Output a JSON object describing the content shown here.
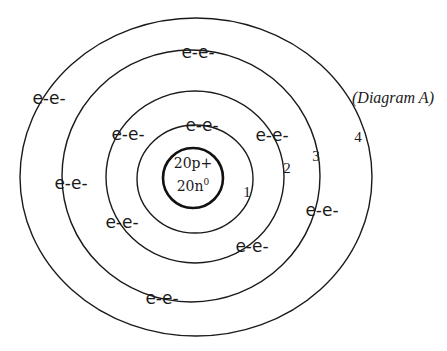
{
  "caption": "(Diagram A)",
  "nucleus": {
    "protons": "20p+",
    "neutrons_base": "20n",
    "neutrons_sup": "0"
  },
  "shells": [
    {
      "number": "1",
      "cx": 195,
      "cy": 179,
      "rx": 58,
      "ry": 54,
      "label_x": 247,
      "label_y": 192
    },
    {
      "number": "2",
      "cx": 195,
      "cy": 177,
      "rx": 89,
      "ry": 86,
      "label_x": 287,
      "label_y": 168
    },
    {
      "number": "3",
      "cx": 191,
      "cy": 176,
      "rx": 129,
      "ry": 126,
      "label_x": 316,
      "label_y": 156
    },
    {
      "number": "4",
      "cx": 196,
      "cy": 177,
      "rx": 176,
      "ry": 159,
      "label_x": 358,
      "label_y": 137
    }
  ],
  "nucleus_shape": {
    "cx": 193,
    "cy": 178,
    "rx": 30,
    "ry": 30
  },
  "electron_pairs": [
    {
      "text": "e-e-",
      "x": 198,
      "y": 52
    },
    {
      "text": "e-e-",
      "x": 49,
      "y": 98
    },
    {
      "text": "e-e-",
      "x": 128,
      "y": 134
    },
    {
      "text": "e-e-",
      "x": 202,
      "y": 125
    },
    {
      "text": "e-e-",
      "x": 272,
      "y": 135
    },
    {
      "text": "e-e-",
      "x": 71,
      "y": 183
    },
    {
      "text": "e-e-",
      "x": 322,
      "y": 210
    },
    {
      "text": "e-e-",
      "x": 122,
      "y": 222
    },
    {
      "text": "e-e-",
      "x": 252,
      "y": 246
    },
    {
      "text": "e-e-",
      "x": 162,
      "y": 298
    }
  ],
  "colors": {
    "stroke": "#1a1a1a",
    "background": "#ffffff"
  }
}
